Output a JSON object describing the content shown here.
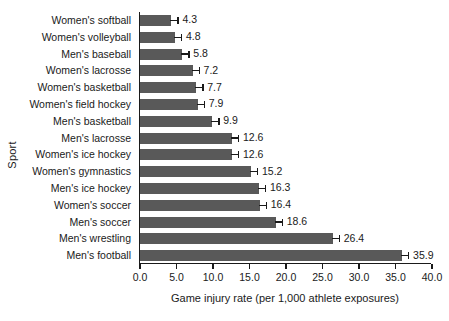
{
  "chart_data": {
    "type": "bar",
    "orientation": "horizontal",
    "title": "",
    "xlabel": "Game injury rate (per 1,000 athlete exposures)",
    "ylabel": "Sport",
    "xlim": [
      0.0,
      40.0
    ],
    "xticks": [
      "0.0",
      "5.0",
      "10.0",
      "15.0",
      "20.0",
      "25.0",
      "30.0",
      "35.0",
      "40.0"
    ],
    "xtick_values": [
      0,
      5,
      10,
      15,
      20,
      25,
      30,
      35,
      40
    ],
    "grid": false,
    "legend": null,
    "bar_color": "#595959",
    "axis_color": "#1a1a1a",
    "categories": [
      "Women's softball",
      "Women's volleyball",
      "Men's baseball",
      "Women's lacrosse",
      "Women's basketball",
      "Women's field hockey",
      "Men's basketball",
      "Men's lacrosse",
      "Women's ice hockey",
      "Women's gymnastics",
      "Men's ice hockey",
      "Women's soccer",
      "Men's soccer",
      "Men's wrestling",
      "Men's football"
    ],
    "values": [
      4.3,
      4.8,
      5.8,
      7.2,
      7.7,
      7.9,
      9.9,
      12.6,
      12.6,
      15.2,
      16.3,
      16.4,
      18.6,
      26.4,
      35.9
    ],
    "value_labels": [
      "4.3",
      "4.8",
      "5.8",
      "7.2",
      "7.7",
      "7.9",
      "9.9",
      "12.6",
      "12.6",
      "15.2",
      "16.3",
      "16.4",
      "18.6",
      "26.4",
      "35.9"
    ]
  }
}
